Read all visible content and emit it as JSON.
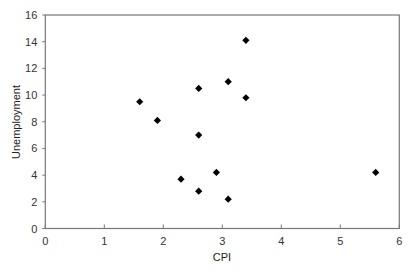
{
  "chart_data": {
    "type": "scatter",
    "title": "",
    "xlabel": "CPI",
    "ylabel": "Unemployment",
    "xlim": [
      0,
      6
    ],
    "ylim": [
      0,
      16
    ],
    "xticks": [
      0,
      1,
      2,
      3,
      4,
      5,
      6
    ],
    "yticks": [
      0,
      2,
      4,
      6,
      8,
      10,
      12,
      14,
      16
    ],
    "grid": false,
    "legend": null,
    "marker": "diamond",
    "marker_color": "#000000",
    "series": [
      {
        "name": "Unemployment vs CPI",
        "x": [
          1.6,
          1.9,
          2.3,
          2.6,
          2.6,
          2.6,
          2.9,
          3.1,
          3.1,
          3.4,
          3.4,
          5.6
        ],
        "y": [
          9.5,
          8.1,
          3.7,
          10.5,
          7.0,
          2.8,
          4.2,
          11.0,
          2.2,
          14.1,
          9.8,
          4.2
        ]
      }
    ]
  },
  "colors": {
    "axis": "#777777",
    "text": "#333333",
    "marker": "#000000"
  }
}
